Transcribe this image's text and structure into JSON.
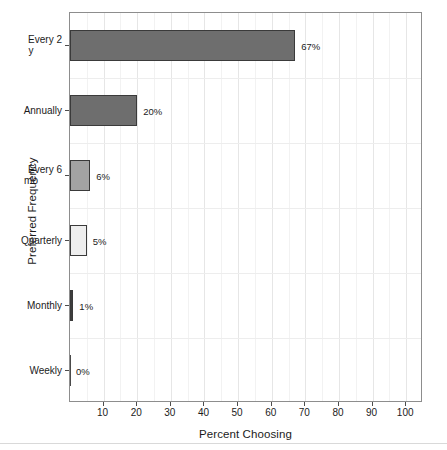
{
  "chart_data": {
    "type": "bar",
    "orientation": "horizontal",
    "title": "",
    "xlabel": "Percent Choosing",
    "ylabel": "Preferred Frequency",
    "categories": [
      "Every 2\ny",
      "Annually",
      "Every 6\nmo",
      "Quarterly",
      "Monthly",
      "Weekly"
    ],
    "values": [
      67,
      20,
      6,
      5,
      1,
      0
    ],
    "data_labels": [
      "67%",
      "20%",
      "6%",
      "5%",
      "1%",
      "0%"
    ],
    "bar_colors": [
      "#6e6e6e",
      "#6e6e6e",
      "#a3a3a3",
      "#eeeeee",
      "#3d3d3d",
      "#4a4a4a"
    ],
    "xlim": [
      0,
      105
    ],
    "xticks": [
      10,
      20,
      30,
      40,
      50,
      60,
      70,
      80,
      90,
      100
    ],
    "xtick_labels": [
      "10",
      "20",
      "30",
      "40",
      "50",
      "60",
      "70",
      "80",
      "90",
      "100"
    ],
    "grid": true,
    "legend": "none"
  },
  "axes": {
    "y_title": "Preferred Frequency",
    "x_title": "Percent Choosing",
    "y_categories": [
      {
        "line1": "Every 2",
        "line2": "y"
      },
      {
        "line1": "Annually",
        "line2": ""
      },
      {
        "line1": "Every 6",
        "line2": "mo"
      },
      {
        "line1": "Quarterly",
        "line2": ""
      },
      {
        "line1": "Monthly",
        "line2": ""
      },
      {
        "line1": "Weekly",
        "line2": ""
      }
    ]
  },
  "colors": {
    "panel_border": "#8d8d8d",
    "grid_major": "#e6e6e6",
    "grid_minor": "#f2f2f2",
    "bar_outline": "#3a3a3a",
    "text": "#1b1b1b",
    "background": "#ffffff"
  }
}
